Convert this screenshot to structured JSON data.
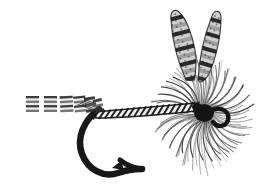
{
  "image": {
    "kind": "illustration",
    "subject": "artificial-dry-fly",
    "title": "Dry fly with barred wings, radial hackle, segmented body and barred tail",
    "width": 260,
    "height": 196,
    "background_color": "#ffffff",
    "ink_color": "#222222",
    "midtone_color": "#6b6b6b",
    "light_color": "#a8a8a8",
    "style": "grayscale halftone line drawing",
    "orientation": "hook eye at right, tail at left"
  },
  "parts": {
    "left_wing": {
      "name": "left wing",
      "description": "upright barred flank feather wing, slanting left",
      "marking": "barred",
      "tone": "#4a4a4a",
      "tip_x": 172,
      "tip_y": 10,
      "base_x": 192,
      "base_y": 82,
      "width": 22,
      "bar_count": 9
    },
    "right_wing": {
      "name": "right wing",
      "description": "upright barred flank feather wing, slanting right",
      "marking": "barred",
      "tone": "#4a4a4a",
      "tip_x": 214,
      "tip_y": 12,
      "base_x": 200,
      "base_y": 82,
      "width": 20,
      "bar_count": 9
    },
    "hackle": {
      "name": "hackle",
      "description": "radial burst of fine hackle barbs around the thread head",
      "center_x": 203,
      "center_y": 113,
      "radius_x": 54,
      "radius_y": 62,
      "barb_count": 96,
      "tone": "#6f6f6f"
    },
    "head": {
      "name": "thread head",
      "description": "dark varnished thread head at the hook eye",
      "center_x": 204,
      "center_y": 113,
      "radius": 9,
      "tone": "#1b1b1b"
    },
    "hook_eye": {
      "name": "hook eye",
      "description": "turned-down wire loop at the front of the hook",
      "center_x": 221,
      "center_y": 116,
      "radius": 7,
      "tone": "#1b1b1b"
    },
    "body": {
      "name": "body",
      "description": "tapered quill body with diagonal rib segmentation along the shank",
      "start_x": 96,
      "start_y": 110,
      "end_x": 196,
      "end_y": 104,
      "segment_count": 17,
      "tone": "#2a2a2a"
    },
    "hook": {
      "name": "hook",
      "description": "curved down-eye dry fly hook with bend, barb and point",
      "shank_tone": "#1b1b1b",
      "bend_start_x": 96,
      "bend_start_y": 110,
      "bend_bottom_x": 106,
      "bend_bottom_y": 172,
      "point_x": 142,
      "point_y": 168,
      "barb_x": 120,
      "barb_y": 162
    },
    "tail": {
      "name": "tail",
      "description": "splayed barred tail fibers trailing to the left of the hook bend",
      "marking": "barred",
      "tone": "#3a3a3a",
      "fiber_count": 6,
      "start_x": 24,
      "end_x": 96,
      "y": 103,
      "fibers": [
        {
          "x": 26,
          "y": 96,
          "w": 13,
          "h": 16,
          "bars": 4,
          "tilt": 0
        },
        {
          "x": 44,
          "y": 96,
          "w": 13,
          "h": 16,
          "bars": 4,
          "tilt": 0
        },
        {
          "x": 60,
          "y": 96,
          "w": 13,
          "h": 16,
          "bars": 4,
          "tilt": -3
        },
        {
          "x": 74,
          "y": 96,
          "w": 12,
          "h": 16,
          "bars": 4,
          "tilt": -6
        },
        {
          "x": 85,
          "y": 97,
          "w": 11,
          "h": 15,
          "bars": 3,
          "tilt": -10
        },
        {
          "x": 94,
          "y": 99,
          "w": 9,
          "h": 13,
          "bars": 3,
          "tilt": -14
        }
      ]
    }
  },
  "palette": {
    "background": "#ffffff",
    "darkest": "#141414",
    "dark": "#2a2a2a",
    "mid": "#5c5c5c",
    "light": "#9a9a9a",
    "faint": "#c8c8c8"
  }
}
